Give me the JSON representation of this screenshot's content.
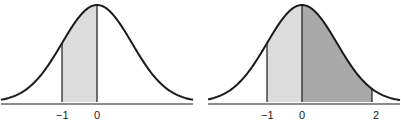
{
  "chart_data": [
    {
      "type": "area",
      "title": "",
      "description": "Standard normal curve with shaded area between z = -1 and z = 0",
      "xlabel": "",
      "ylabel": "",
      "tick_labels": [
        "−1",
        "0"
      ],
      "shaded_regions": [
        {
          "from": -1,
          "to": 0,
          "color": "#dcdcdc"
        }
      ],
      "mean": 0,
      "std": 1
    },
    {
      "type": "area",
      "title": "",
      "description": "Standard normal curve with shaded areas between z = -1 and z = 0 (light) and z = 0 and z = 2 (dark)",
      "xlabel": "",
      "ylabel": "",
      "tick_labels": [
        "−1",
        "0",
        "2"
      ],
      "shaded_regions": [
        {
          "from": -1,
          "to": 0,
          "color": "#dcdcdc"
        },
        {
          "from": 0,
          "to": 2,
          "color": "#a9a9a9"
        }
      ],
      "mean": 0,
      "std": 1
    }
  ],
  "left": {
    "ticks": [
      "−1",
      "0"
    ]
  },
  "right": {
    "ticks": [
      "−1",
      "0",
      "2"
    ]
  },
  "colors": {
    "light": "#dcdcdc",
    "dark": "#a9a9a9",
    "line": "#1a1a1a"
  }
}
